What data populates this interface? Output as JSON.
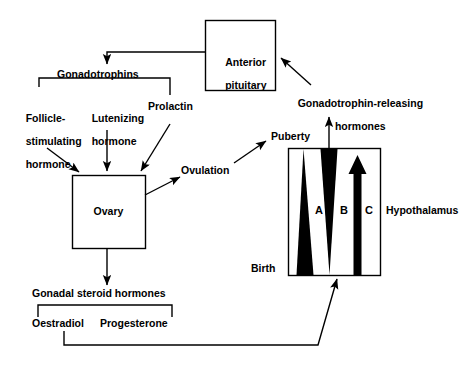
{
  "diagram": {
    "colors": {
      "stroke": "#000000",
      "fill_shape": "#000000",
      "background": "#ffffff"
    },
    "boxes": [
      {
        "id": "anterior-pituitary",
        "label": "Anterior\npituitary",
        "line1": "Anterior",
        "line2": "pituitary",
        "x": 205,
        "y": 20,
        "w": 70,
        "h": 70
      },
      {
        "id": "ovary",
        "label": "Ovary",
        "x": 72,
        "y": 175,
        "w": 73,
        "h": 73
      },
      {
        "id": "hypothalamus",
        "label": "Hypothalamus",
        "x": 288,
        "y": 148,
        "w": 93,
        "h": 127
      }
    ],
    "labels": {
      "gonadotrophins": "Gonadotrophins",
      "follicle_stimulating_hormone": "Follicle-\nstimulating\nhormone",
      "fsh_line1": "Follicle-",
      "fsh_line2": "stimulating",
      "fsh_line3": "hormone",
      "lutenizing_hormone_line1": "Lutenizing",
      "lutenizing_hormone_line2": "hormone",
      "prolactin": "Prolactin",
      "ovulation": "Ovulation",
      "gonadal_steroid_hormones": "Gonadal steroid hormones",
      "oestradiol": "Oestradiol",
      "progesterone": "Progesterone",
      "gnrh_line1": "Gonadotrophin-releasing",
      "gnrh_line2": "hormones",
      "puberty": "Puberty",
      "birth": "Birth",
      "hypothalamus": "Hypothalamus",
      "ovary": "Ovary",
      "anterior_pituitary_line1": "Anterior",
      "anterior_pituitary_line2": "pituitary"
    },
    "hypothalamus_shapes": [
      {
        "id": "shape-a",
        "letter": "A",
        "form": "triangle-down-wide-bottom",
        "description": "solid black triangle, wide at Birth (bottom), tapering to point at Puberty (top)"
      },
      {
        "id": "shape-b",
        "letter": "B",
        "form": "triangle-up-wide-top",
        "description": "solid black triangle, wide at Puberty (top), tapering to point at Birth (bottom)"
      },
      {
        "id": "shape-c",
        "letter": "C",
        "form": "upward-arrow",
        "description": "solid black vertical arrow pointing up toward Puberty"
      }
    ],
    "axis": {
      "top": "Puberty",
      "bottom": "Birth"
    }
  }
}
